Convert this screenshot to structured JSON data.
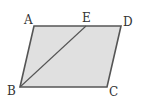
{
  "figure": {
    "type": "parallelogram",
    "fill": "#e0e0e0",
    "stroke": "#555555",
    "vertices": {
      "A": {
        "label": "A",
        "x": 34,
        "y": 26
      },
      "D": {
        "label": "D",
        "x": 121,
        "y": 26
      },
      "C": {
        "label": "C",
        "x": 107,
        "y": 87
      },
      "B": {
        "label": "B",
        "x": 20,
        "y": 87
      }
    },
    "point_E": {
      "label": "E",
      "x": 86,
      "y": 26
    },
    "segment": "BE"
  }
}
